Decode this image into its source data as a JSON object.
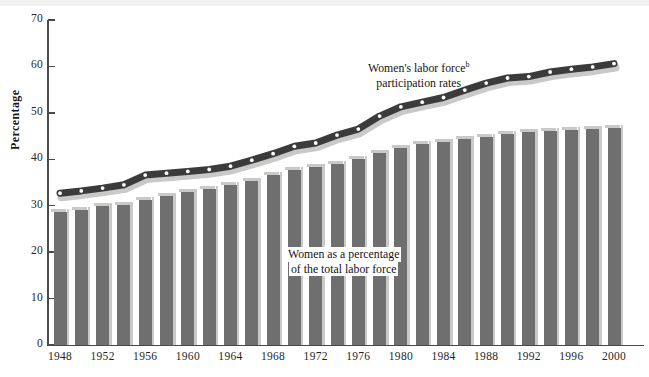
{
  "axes": {
    "ylabel": "Percentage",
    "yticks": [
      0,
      10,
      20,
      30,
      40,
      50,
      60,
      70
    ],
    "ylim": [
      0,
      70
    ],
    "xticklabels": [
      "1948",
      "1952",
      "1956",
      "1960",
      "1964",
      "1968",
      "1972",
      "1976",
      "1980",
      "1984",
      "1988",
      "1992",
      "1996",
      "2000"
    ]
  },
  "annotations": {
    "line_label_line1": "Women's labor force",
    "line_label_sup": "b",
    "line_label_line2": "participation rates",
    "bar_label_line1": "Women as a percentage",
    "bar_label_line2": "of the total labor force"
  },
  "colors": {
    "bar_fill": "#6f6f6f",
    "bar_highlight": "#c9c9c7",
    "line_dark": "#3b3b3b",
    "line_shadow": "#c9c9c7",
    "marker": "#ffffff",
    "axis": "#4a4a4a",
    "text": "#141414",
    "background": "#ffffff"
  },
  "chart_data": {
    "type": "bar",
    "title": "",
    "xlabel": "",
    "ylabel": "Percentage",
    "ylim": [
      0,
      70
    ],
    "grid": false,
    "legend": "annotations-inline",
    "categories": [
      1948,
      1950,
      1952,
      1954,
      1956,
      1958,
      1960,
      1962,
      1964,
      1966,
      1968,
      1970,
      1972,
      1974,
      1976,
      1978,
      1980,
      1982,
      1984,
      1986,
      1988,
      1990,
      1992,
      1994,
      1996,
      1998,
      2000
    ],
    "series": [
      {
        "name": "Women as a percentage of the total labor force",
        "type": "bar",
        "values": [
          28.6,
          29.0,
          30.0,
          30.2,
          31.3,
          32.0,
          33.0,
          33.5,
          34.4,
          35.4,
          36.6,
          37.6,
          38.4,
          39.0,
          40.1,
          41.4,
          42.4,
          43.2,
          43.7,
          44.4,
          44.9,
          45.4,
          45.8,
          46.2,
          46.3,
          46.6,
          46.8
        ]
      },
      {
        "name": "Women's labor force participation rates",
        "type": "line",
        "values": [
          32.7,
          33.2,
          33.8,
          34.5,
          36.6,
          37.0,
          37.4,
          37.8,
          38.5,
          39.8,
          41.2,
          42.8,
          43.5,
          45.2,
          46.5,
          49.3,
          51.3,
          52.3,
          53.3,
          54.9,
          56.4,
          57.5,
          57.8,
          58.8,
          59.4,
          59.9,
          60.6
        ]
      }
    ]
  }
}
